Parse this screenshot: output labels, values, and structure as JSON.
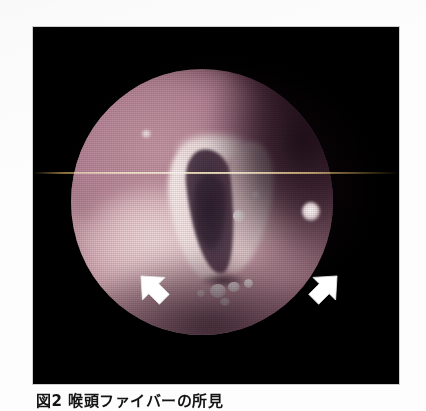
{
  "page": {
    "background_color": "#fdfdfd",
    "type": "scanned-journal-figure"
  },
  "figure": {
    "name": "laryngoscopic-photograph",
    "modality": "laryngeal fiberscopy / endoscopy",
    "frame_color": "#000000",
    "frame": {
      "x": 33,
      "y": 27,
      "width": 366,
      "height": 357
    },
    "field_of_view": {
      "shape": "circle",
      "x": 71,
      "y": 69,
      "width": 262,
      "height": 266
    },
    "anatomy": {
      "glottis_label": "glottic opening",
      "glottis_color": "#4a3748",
      "vocal_cord_color": "#f4e3e3",
      "mucosa_color": "#b98f9c",
      "bright_mucosa_color": "#e8cdd0",
      "shadow_color": "#2a1420"
    },
    "artifacts": {
      "scanline_label": "horizontal scan line",
      "scanline_color": "#ffdb96",
      "raster_label": "video raster texture"
    },
    "annotations": [
      {
        "name": "arrow-left",
        "label": "white arrow",
        "color": "#ffffff",
        "direction": "up-right",
        "x": 100,
        "y": 243
      },
      {
        "name": "arrow-right",
        "label": "white arrow",
        "color": "#ffffff",
        "direction": "up-left",
        "x": 272,
        "y": 243
      }
    ]
  },
  "caption": {
    "text": "図2 喉頭ファイバーの所見",
    "note": "cropped at bottom page edge"
  }
}
